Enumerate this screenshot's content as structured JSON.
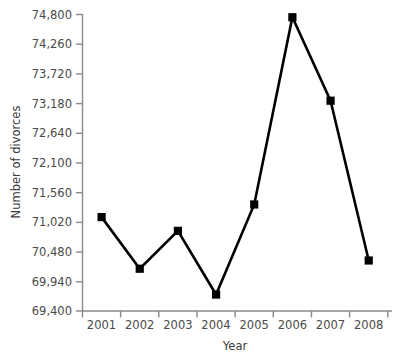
{
  "chart_data": {
    "type": "line",
    "title": "",
    "xlabel": "Year",
    "ylabel": "Number of divorces",
    "categories": [
      "2001",
      "2002",
      "2003",
      "2004",
      "2005",
      "2006",
      "2007",
      "2008"
    ],
    "values": [
      71110,
      70170,
      70860,
      69700,
      71340,
      74750,
      73230,
      70320
    ],
    "series": [
      {
        "name": "Number of divorces",
        "values": [
          71110,
          70170,
          70860,
          69700,
          71340,
          74750,
          73230,
          70320
        ]
      }
    ],
    "ylim": [
      69400,
      74800
    ],
    "ytick_values": [
      69400,
      69940,
      70480,
      71020,
      71560,
      72100,
      72640,
      73180,
      73720,
      74260,
      74800
    ],
    "ytick_labels": [
      "69,400",
      "69,940",
      "70,480",
      "71,020",
      "71,560",
      "72,100",
      "72,640",
      "73,180",
      "73,720",
      "74,260",
      "74,800"
    ],
    "ytick_step": 540,
    "xtick_labels": [
      "2001",
      "2002",
      "2003",
      "2004",
      "2005",
      "2006",
      "2007",
      "2008"
    ],
    "grid": false,
    "legend": "none",
    "marker_shape": "square",
    "line_color": "#000000",
    "marker_color": "#000000",
    "axis_color": "#8a8a8a",
    "background_color": "#ffffff"
  },
  "axes": {
    "y_title": "Number of divorces",
    "x_title": "Year"
  }
}
